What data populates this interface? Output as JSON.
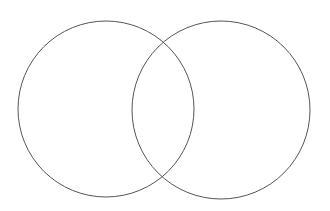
{
  "diagram": {
    "type": "venn",
    "background": "#ffffff",
    "stroke_color": "#555555",
    "stroke_width": 1,
    "circles": [
      {
        "name": "left-set",
        "cx": 106,
        "cy": 109,
        "r": 88
      },
      {
        "name": "right-set",
        "cx": 221,
        "cy": 110,
        "r": 89
      }
    ],
    "labels": []
  }
}
